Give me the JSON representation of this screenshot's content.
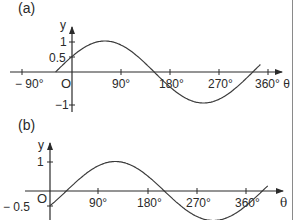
{
  "chart_data": [
    {
      "type": "line",
      "panel_label": "(a)",
      "xlabel": "θ",
      "ylabel": "y",
      "origin_label": "O",
      "x_ticks": [
        -90,
        90,
        180,
        270,
        360
      ],
      "x_tick_labels": [
        "− 90°",
        "90°",
        "180°",
        "270°",
        "360° θ"
      ],
      "y_ticks": [
        1,
        0.5,
        -1
      ],
      "y_tick_labels": [
        "1",
        "0.5",
        "−1"
      ],
      "xlim": [
        -100,
        375
      ],
      "ylim": [
        -1.2,
        1.3
      ],
      "grid": false,
      "function": "y = sin(θ + 30°)",
      "x": [
        -30,
        0,
        60,
        150,
        240,
        330,
        345
      ],
      "y": [
        0,
        0.5,
        1,
        0,
        -1,
        0,
        0.26
      ],
      "series": [
        {
          "name": "curve a",
          "phase_deg": 30,
          "x_start": -30,
          "x_end": 345
        }
      ]
    },
    {
      "type": "line",
      "panel_label": "(b)",
      "xlabel": "θ",
      "ylabel": "y",
      "origin_label": "O",
      "x_ticks": [
        90,
        180,
        270,
        360
      ],
      "x_tick_labels": [
        "90°",
        "180°",
        "270°",
        "360°"
      ],
      "y_ticks": [
        1,
        -0.5
      ],
      "y_tick_labels": [
        "1",
        "− 0.5"
      ],
      "xlim": [
        -20,
        410
      ],
      "ylim": [
        -0.6,
        1.3
      ],
      "grid": false,
      "function": "y = sin(θ − 30°)",
      "x": [
        0,
        30,
        120,
        210,
        300,
        390,
        400
      ],
      "y": [
        -0.5,
        0,
        1,
        0,
        -1,
        0,
        0.17
      ],
      "series": [
        {
          "name": "curve b",
          "phase_deg": -30,
          "x_start": 0,
          "x_end": 400
        }
      ]
    }
  ],
  "colors": {
    "ink": "#2a2a2a",
    "background": "#ffffff",
    "border": "#8a8a8a"
  }
}
